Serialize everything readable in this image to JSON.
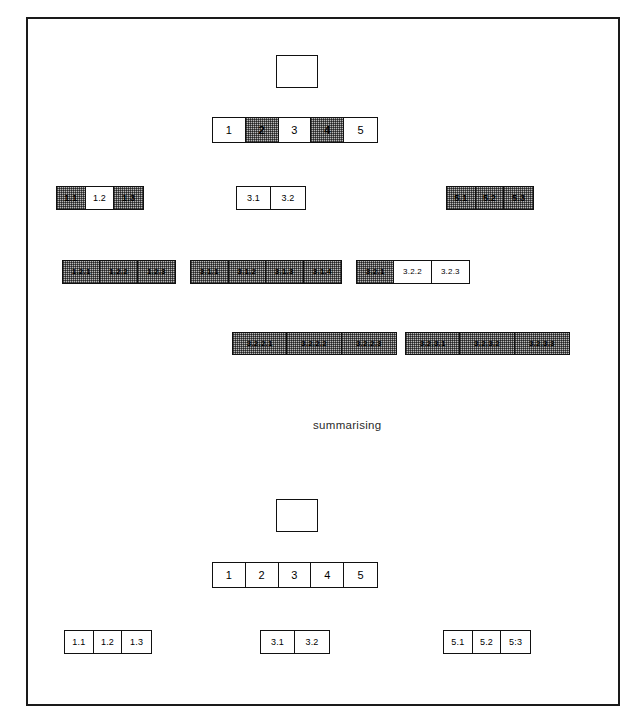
{
  "figure": {
    "caption": "summarising",
    "frame": {
      "stroke": "#1a1a1a"
    },
    "palette": {
      "line": "#111111",
      "shade": "#b9b9b9",
      "background": "#ffffff"
    }
  },
  "top_section": {
    "root": {
      "label": ""
    },
    "level1": {
      "cells": [
        {
          "label": "1",
          "shaded": false
        },
        {
          "label": "2",
          "shaded": true
        },
        {
          "label": "3",
          "shaded": false
        },
        {
          "label": "4",
          "shaded": true
        },
        {
          "label": "5",
          "shaded": false
        }
      ]
    },
    "level2": {
      "group_1": [
        {
          "label": "1.1",
          "shaded": true
        },
        {
          "label": "1.2",
          "shaded": false
        },
        {
          "label": "1.3",
          "shaded": true
        }
      ],
      "group_3": [
        {
          "label": "3.1",
          "shaded": false
        },
        {
          "label": "3.2",
          "shaded": false
        }
      ],
      "group_5": [
        {
          "label": "5.1",
          "shaded": true
        },
        {
          "label": "5.2",
          "shaded": true
        },
        {
          "label": "5.3",
          "shaded": true
        }
      ]
    },
    "level3": {
      "group_12": [
        {
          "label": "1.2.1",
          "shaded": true
        },
        {
          "label": "1.2.2",
          "shaded": true
        },
        {
          "label": "1.2.3",
          "shaded": true
        }
      ],
      "group_31": [
        {
          "label": "3.1.1",
          "shaded": true
        },
        {
          "label": "3.1.2",
          "shaded": true
        },
        {
          "label": "3.1.3",
          "shaded": true
        },
        {
          "label": "3.1.4",
          "shaded": true
        }
      ],
      "group_32": [
        {
          "label": "3.2.1",
          "shaded": true
        },
        {
          "label": "3.2.2",
          "shaded": false
        },
        {
          "label": "3.2.3",
          "shaded": false
        }
      ]
    },
    "level4": {
      "group_322": [
        {
          "label": "3.2.2.1",
          "shaded": true
        },
        {
          "label": "3.2.2.2",
          "shaded": true
        },
        {
          "label": "3.2.2.3",
          "shaded": true
        }
      ],
      "group_323": [
        {
          "label": "3.2.3.1",
          "shaded": true
        },
        {
          "label": "3.2.3.2",
          "shaded": true
        },
        {
          "label": "3.2.3.3",
          "shaded": true
        }
      ]
    }
  },
  "bottom_section": {
    "root": {
      "label": ""
    },
    "level1": {
      "cells": [
        {
          "label": "1",
          "shaded": false
        },
        {
          "label": "2",
          "shaded": false
        },
        {
          "label": "3",
          "shaded": false
        },
        {
          "label": "4",
          "shaded": false
        },
        {
          "label": "5",
          "shaded": false
        }
      ]
    },
    "level2": {
      "group_1": [
        {
          "label": "1.1",
          "shaded": false
        },
        {
          "label": "1.2",
          "shaded": false
        },
        {
          "label": "1.3",
          "shaded": false
        }
      ],
      "group_3": [
        {
          "label": "3.1",
          "shaded": false
        },
        {
          "label": "3.2",
          "shaded": false
        }
      ],
      "group_5": [
        {
          "label": "5.1",
          "shaded": false
        },
        {
          "label": "5.2",
          "shaded": false
        },
        {
          "label": "5:3",
          "shaded": false
        }
      ]
    }
  }
}
